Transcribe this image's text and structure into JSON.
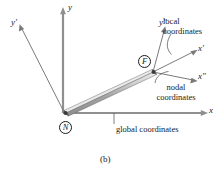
{
  "figure": {
    "caption": "(b)",
    "background_color": "#ffffff",
    "line_color": "#4a4a4a",
    "text_color": "#1a1a1a",
    "bar_top_color": "#e8e8e8",
    "bar_body_color": "#9a9a9a",
    "bar_edge_color": "#6e6e6e"
  },
  "axes": {
    "global": [
      {
        "name": "y-axis",
        "label": "y",
        "prime": "",
        "orientation": "vertical"
      },
      {
        "name": "x-axis",
        "label": "x",
        "prime": "",
        "orientation": "horizontal"
      }
    ],
    "local": [
      {
        "name": "y-prime-axis",
        "label": "y",
        "prime": "′",
        "anchor_node": "N"
      },
      {
        "name": "x-prime-axis",
        "label": "x",
        "prime": "′",
        "anchor_node": "F"
      }
    ],
    "nodal": [
      {
        "name": "y-double-prime-axis",
        "label": "y",
        "prime": "″",
        "anchor_node": "F"
      },
      {
        "name": "x-double-prime-axis",
        "label": "x",
        "prime": "″",
        "anchor_node": "F"
      }
    ]
  },
  "nodes": [
    {
      "id": "N",
      "label": "N",
      "role": "near-node"
    },
    {
      "id": "F",
      "label": "F",
      "role": "far-node"
    }
  ],
  "annotations": [
    {
      "id": "local",
      "line1": "local",
      "line2": "coordinates"
    },
    {
      "id": "nodal",
      "line1": "nodal",
      "line2": "coordinates"
    },
    {
      "id": "global",
      "line1": "global coordinates",
      "line2": ""
    }
  ],
  "labels": {
    "y": "y",
    "x": "x",
    "y_prime": "y",
    "x_prime": "x",
    "y_double_prime": "y",
    "x_double_prime": "x",
    "prime_mark": "′",
    "double_prime_mark": "″",
    "node_n": "N",
    "node_f": "F",
    "local_line1": "local",
    "local_line2": "coordinates",
    "nodal_line1": "nodal",
    "nodal_line2": "coordinates",
    "global_text": "global coordinates",
    "caption": "(b)"
  }
}
